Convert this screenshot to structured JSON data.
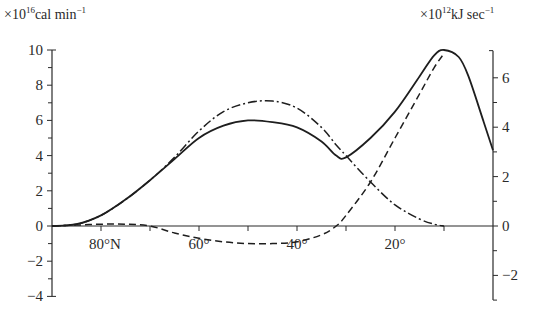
{
  "chart_data": {
    "type": "line",
    "title": "",
    "xlabel": "",
    "ylabel_left": "×10^16 cal min^-1",
    "ylabel_right": "×10^12 kJ sec^-1",
    "left_axis": {
      "unit_prefix": "×10",
      "unit_exp": "16",
      "unit_text": "cal min",
      "unit_tail_exp": "−1",
      "ticks": [
        10,
        8,
        6,
        4,
        2,
        0,
        -2,
        -4
      ],
      "tick_labels": [
        "10",
        "8",
        "6",
        "4",
        "2",
        "0",
        "−2",
        "−4"
      ],
      "ylim": [
        -4,
        10
      ]
    },
    "right_axis": {
      "unit_prefix": "×10",
      "unit_exp": "12",
      "unit_text": "kJ sec",
      "unit_tail_exp": "−1",
      "ticks": [
        6,
        4,
        2,
        0,
        -2
      ],
      "tick_labels": [
        "6",
        "4",
        "2",
        "0",
        "−2"
      ],
      "ylim": [
        -3,
        7
      ]
    },
    "x_axis": {
      "variable": "latitude (°N)",
      "range": [
        90,
        0
      ],
      "tick_positions": [
        80,
        70,
        60,
        50,
        40,
        30,
        20,
        10
      ],
      "labels": [
        {
          "lat": 80,
          "text": "80°N"
        },
        {
          "lat": 60,
          "text": "60°"
        },
        {
          "lat": 40,
          "text": "40°"
        },
        {
          "lat": 20,
          "text": "20°"
        }
      ]
    },
    "grid": false,
    "legend": null,
    "x": [
      90,
      85,
      80,
      75,
      70,
      65,
      60,
      55,
      50,
      45,
      40,
      35,
      32,
      30,
      25,
      20,
      15,
      12,
      10,
      7,
      5,
      2,
      0
    ],
    "series": [
      {
        "name": "total (solid)",
        "style": "solid",
        "values": [
          0,
          0.1,
          0.6,
          1.5,
          2.6,
          3.8,
          5.0,
          5.7,
          6.0,
          5.9,
          5.6,
          4.8,
          4.0,
          3.9,
          5.0,
          6.5,
          8.5,
          9.7,
          10.0,
          9.6,
          8.5,
          6.0,
          4.3
        ]
      },
      {
        "name": "dash-dot component",
        "style": "dashdot",
        "values": [
          0,
          0.1,
          0.6,
          1.5,
          2.6,
          3.9,
          5.4,
          6.5,
          7.0,
          7.1,
          6.7,
          5.6,
          4.6,
          4.0,
          2.5,
          1.2,
          0.4,
          0.1,
          0,
          null,
          null,
          null,
          null
        ]
      },
      {
        "name": "dashed component",
        "style": "dashed",
        "values": [
          0,
          0.05,
          0.1,
          0.1,
          0,
          -0.4,
          -0.7,
          -0.9,
          -1.0,
          -1.0,
          -0.9,
          -0.5,
          0,
          0.6,
          2.5,
          5.0,
          7.5,
          9.0,
          9.8,
          null,
          null,
          null,
          null
        ]
      }
    ]
  }
}
